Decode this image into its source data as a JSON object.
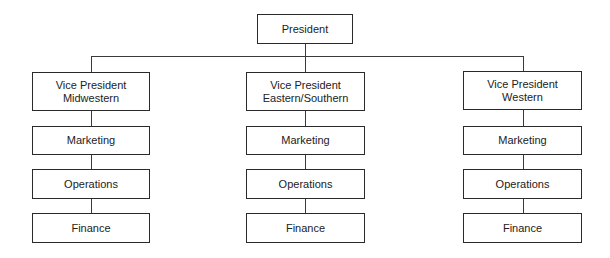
{
  "chart": {
    "root": {
      "label": "President"
    },
    "columns": [
      {
        "vp": {
          "line1": "Vice President",
          "line2": "Midwestern"
        },
        "departments": [
          "Marketing",
          "Operations",
          "Finance"
        ]
      },
      {
        "vp": {
          "line1": "Vice President",
          "line2": "Eastern/Southern"
        },
        "departments": [
          "Marketing",
          "Operations",
          "Finance"
        ]
      },
      {
        "vp": {
          "line1": "Vice President",
          "line2": "Western"
        },
        "departments": [
          "Marketing",
          "Operations",
          "Finance"
        ]
      }
    ]
  }
}
